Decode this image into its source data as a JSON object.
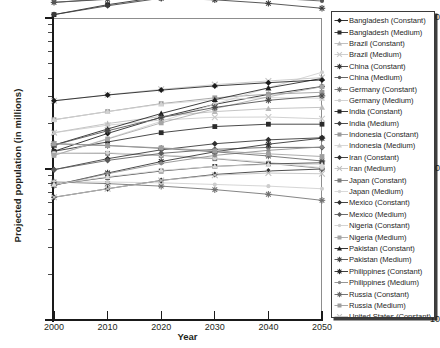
{
  "chart_data": {
    "type": "line",
    "title": "",
    "xlabel": "Year",
    "ylabel": "Projected population (in millions)",
    "x": [
      2000,
      2010,
      2020,
      2030,
      2040,
      2050
    ],
    "xtick_labels": [
      "2000",
      "2010",
      "2020",
      "2030",
      "2040",
      "2050"
    ],
    "ytick_labels": [
      "10",
      "100",
      "1,000"
    ],
    "ytick_values": [
      10,
      100,
      1000
    ],
    "yscale": "log",
    "ylim": [
      10,
      1000
    ],
    "xlim": [
      2000,
      2050
    ],
    "grid": false,
    "legend_position": "right-outside",
    "series": [
      {
        "name": "Bangladesh (Constant)",
        "marker": "diamond",
        "color": "#1b1b1b",
        "values": [
          131,
          172,
          220,
          268,
          312,
          352
        ]
      },
      {
        "name": "Bangladesh (Medium)",
        "marker": "square",
        "color": "#2b2b2b",
        "values": [
          131,
          151,
          174,
          191,
          198,
          198
        ]
      },
      {
        "name": "Brazil (Constant)",
        "marker": "triangle",
        "color": "#b9b9b9",
        "values": [
          174,
          200,
          223,
          240,
          251,
          256
        ]
      },
      {
        "name": "Brazil (Medium)",
        "marker": "cross",
        "color": "#c9c9c9",
        "values": [
          174,
          195,
          211,
          220,
          221,
          215
        ]
      },
      {
        "name": "China (Constant)",
        "marker": "star",
        "color": "#3b3b3b",
        "values": [
          1270,
          1330,
          1350,
          1320,
          1250,
          1160
        ]
      },
      {
        "name": "China (Medium)",
        "marker": "circle",
        "color": "#555555",
        "values": [
          1270,
          1341,
          1388,
          1393,
          1360,
          1296
        ]
      },
      {
        "name": "Germany (Constant)",
        "marker": "star",
        "color": "#6f6f6f",
        "values": [
          82,
          80,
          77,
          73,
          68,
          62
        ]
      },
      {
        "name": "Germany (Medium)",
        "marker": "circle",
        "color": "#cdcdcd",
        "values": [
          82,
          82,
          81,
          79,
          77,
          74
        ]
      },
      {
        "name": "India (Constant)",
        "marker": "square",
        "color": "#252525",
        "values": [
          1053,
          1225,
          1380,
          1503,
          1592,
          1640
        ]
      },
      {
        "name": "India (Medium)",
        "marker": "diamond",
        "color": "#3a3a3a",
        "values": [
          1053,
          1205,
          1353,
          1476,
          1566,
          1614
        ]
      },
      {
        "name": "Indonesia (Constant)",
        "marker": "square",
        "color": "#9a9a9a",
        "values": [
          212,
          240,
          271,
          296,
          313,
          322
        ]
      },
      {
        "name": "Indonesia (Medium)",
        "marker": "triangle",
        "color": "#d2d2d2",
        "values": [
          212,
          240,
          269,
          288,
          297,
          294
        ]
      },
      {
        "name": "Iran (Constant)",
        "marker": "diamond",
        "color": "#2f2f2f",
        "values": [
          65,
          74,
          84,
          92,
          97,
          100
        ]
      },
      {
        "name": "Iran (Medium)",
        "marker": "cross",
        "color": "#c0c0c0",
        "values": [
          65,
          74,
          84,
          91,
          94,
          93
        ]
      },
      {
        "name": "Japan (Constant)",
        "marker": "square",
        "color": "#7c7c7c",
        "values": [
          127,
          127,
          123,
          117,
          109,
          101
        ]
      },
      {
        "name": "Japan (Medium)",
        "marker": "circle",
        "color": "#d6d6d6",
        "values": [
          127,
          128,
          124,
          118,
          111,
          102
        ]
      },
      {
        "name": "Mexico (Constant)",
        "marker": "diamond",
        "color": "#303030",
        "values": [
          99,
          117,
          134,
          147,
          156,
          161
        ]
      },
      {
        "name": "Mexico (Medium)",
        "marker": "diamond",
        "color": "#5b5b5b",
        "values": [
          99,
          114,
          127,
          135,
          139,
          139
        ]
      },
      {
        "name": "Nigeria (Constant)",
        "marker": "circle",
        "color": "#cfcfcf",
        "values": [
          123,
          159,
          207,
          269,
          345,
          437
        ]
      },
      {
        "name": "Nigeria (Medium)",
        "marker": "square",
        "color": "#a6a6a6",
        "values": [
          123,
          158,
          202,
          251,
          301,
          351
        ]
      },
      {
        "name": "Pakistan (Constant)",
        "marker": "triangle",
        "color": "#1f1f1f",
        "values": [
          144,
          184,
          233,
          288,
          344,
          398
        ]
      },
      {
        "name": "Pakistan (Medium)",
        "marker": "star",
        "color": "#4a4a4a",
        "values": [
          144,
          179,
          219,
          256,
          285,
          305
        ]
      },
      {
        "name": "Philippines (Constant)",
        "marker": "star",
        "color": "#2a2a2a",
        "values": [
          78,
          94,
          112,
          130,
          146,
          160
        ]
      },
      {
        "name": "Philippines (Medium)",
        "marker": "circle",
        "color": "#8a8a8a",
        "values": [
          78,
          93,
          109,
          123,
          133,
          140
        ]
      },
      {
        "name": "Russia (Constant)",
        "marker": "star",
        "color": "#676767",
        "values": [
          147,
          143,
          137,
          130,
          122,
          113
        ]
      },
      {
        "name": "Russia (Medium)",
        "marker": "square",
        "color": "#9e9e9e",
        "values": [
          147,
          143,
          138,
          132,
          126,
          121
        ]
      },
      {
        "name": "United States (Constant)",
        "marker": "cross",
        "color": "#c4c4c4",
        "values": [
          283,
          310,
          337,
          362,
          383,
          403
        ]
      },
      {
        "name": "United States (Medium)",
        "marker": "diamond",
        "color": "#1c1c1c",
        "values": [
          283,
          309,
          333,
          355,
          373,
          389
        ]
      },
      {
        "name": "Vietnam (Constant)",
        "marker": "square",
        "color": "#3d3d3d",
        "values": [
          79,
          88,
          97,
          104,
          108,
          110
        ]
      },
      {
        "name": "Vietnam (Medium)",
        "marker": "triangle",
        "color": "#dadada",
        "values": [
          79,
          89,
          98,
          104,
          107,
          107
        ]
      }
    ]
  },
  "axes": {
    "y_title": "Projected population (in millions)",
    "x_title": "Year"
  },
  "legend": {
    "items": [
      {
        "label": "Bangladesh (Constant)"
      },
      {
        "label": "Bangladesh (Medium)"
      },
      {
        "label": "Brazil (Constant)"
      },
      {
        "label": "Brazil (Medium)"
      },
      {
        "label": "China (Constant)"
      },
      {
        "label": "China (Medium)"
      },
      {
        "label": "Germany (Constant)"
      },
      {
        "label": "Germany (Medium)"
      },
      {
        "label": "India (Constant)"
      },
      {
        "label": "India (Medium)"
      },
      {
        "label": "Indonesia (Constant)"
      },
      {
        "label": "Indonesia (Medium)"
      },
      {
        "label": "Iran (Constant)"
      },
      {
        "label": "Iran (Medium)"
      },
      {
        "label": "Japan (Constant)"
      },
      {
        "label": "Japan (Medium)"
      },
      {
        "label": "Mexico (Constant)"
      },
      {
        "label": "Mexico (Medium)"
      },
      {
        "label": "Nigeria (Constant)"
      },
      {
        "label": "Nigeria (Medium)"
      },
      {
        "label": "Pakistan (Constant)"
      },
      {
        "label": "Pakistan (Medium)"
      },
      {
        "label": "Philippines (Constant)"
      },
      {
        "label": "Philippines (Medium)"
      },
      {
        "label": "Russia (Constant)"
      },
      {
        "label": "Russia (Medium)"
      },
      {
        "label": "United States (Constant)"
      },
      {
        "label": "United States (Medium)"
      },
      {
        "label": "Vietnam (Constant)"
      },
      {
        "label": "Vietnam (Medium)"
      }
    ]
  }
}
